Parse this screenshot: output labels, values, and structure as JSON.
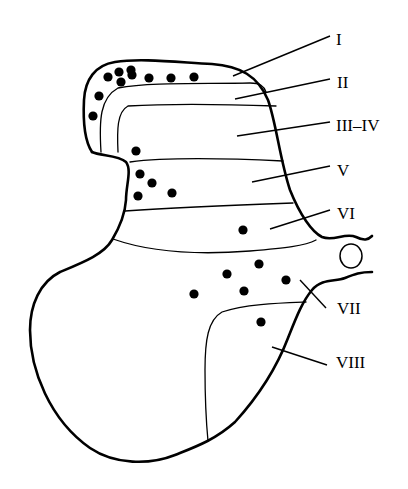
{
  "figure": {
    "stroke_color": "#000000",
    "background_color": "#ffffff"
  },
  "labels": [
    {
      "id": "I",
      "text": "I",
      "x": 336,
      "y": 31,
      "leader": [
        233,
        76,
        330,
        36
      ]
    },
    {
      "id": "II",
      "text": "II",
      "x": 337,
      "y": 74,
      "leader": [
        235,
        99,
        330,
        79
      ]
    },
    {
      "id": "III-IV",
      "text": "III–IV",
      "x": 336,
      "y": 117,
      "leader": [
        237,
        136,
        330,
        122
      ]
    },
    {
      "id": "V",
      "text": "V",
      "x": 337,
      "y": 162,
      "leader": [
        252,
        182,
        330,
        166
      ]
    },
    {
      "id": "VI",
      "text": "VI",
      "x": 337,
      "y": 205,
      "leader": [
        270,
        229,
        330,
        210
      ]
    },
    {
      "id": "VII",
      "text": "VII",
      "x": 337,
      "y": 300,
      "leader": [
        300,
        280,
        326,
        308
      ]
    },
    {
      "id": "VIII",
      "text": "VIII",
      "x": 336,
      "y": 354,
      "leader": [
        272,
        347,
        327,
        365
      ]
    }
  ],
  "dots": [
    {
      "x": 119,
      "y": 72
    },
    {
      "x": 131,
      "y": 70
    },
    {
      "x": 108,
      "y": 77
    },
    {
      "x": 121,
      "y": 82
    },
    {
      "x": 132,
      "y": 75
    },
    {
      "x": 149,
      "y": 78
    },
    {
      "x": 171,
      "y": 78
    },
    {
      "x": 194,
      "y": 77
    },
    {
      "x": 99,
      "y": 96
    },
    {
      "x": 93,
      "y": 116
    },
    {
      "x": 136,
      "y": 151
    },
    {
      "x": 140,
      "y": 174
    },
    {
      "x": 152,
      "y": 183
    },
    {
      "x": 138,
      "y": 196
    },
    {
      "x": 172,
      "y": 193
    },
    {
      "x": 243,
      "y": 230
    },
    {
      "x": 259,
      "y": 264
    },
    {
      "x": 227,
      "y": 274
    },
    {
      "x": 286,
      "y": 280
    },
    {
      "x": 244,
      "y": 291
    },
    {
      "x": 194,
      "y": 294
    },
    {
      "x": 261,
      "y": 322
    }
  ]
}
